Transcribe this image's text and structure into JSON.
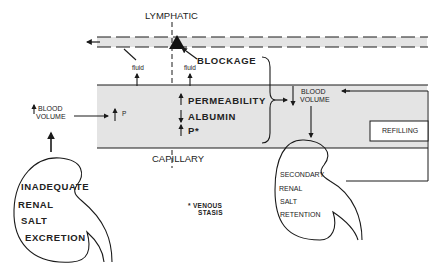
{
  "diagram": {
    "lymphatic": {
      "label": "LYMPHATIC",
      "blockage_label": "BLOCKAGE"
    },
    "fluid_labels": [
      "fluid",
      "fluid"
    ],
    "capillary": {
      "label": "CAPILLARY",
      "left_factor": "P",
      "right_factors": [
        "PERMEABILITY",
        "ALBUMIN",
        "P*"
      ],
      "right_factor_directions": [
        "up",
        "down",
        "up"
      ]
    },
    "left_blood_volume": {
      "line1": "BLOOD",
      "line2": "VOLUME",
      "direction": "up"
    },
    "right_blood_volume": {
      "line1": "BLOOD",
      "line2": "VOLUME",
      "direction": "down"
    },
    "refilling": {
      "label": "REFILLING"
    },
    "left_kidney": {
      "lines": [
        "INADEQUATE",
        "RENAL",
        "SALT",
        "EXCRETION"
      ]
    },
    "right_kidney": {
      "lines": [
        "SECONDARY",
        "RENAL",
        "SALT",
        "RETENTION"
      ]
    },
    "footnote": {
      "symbol": "*",
      "line1": "VENOUS",
      "line2": "STASIS"
    },
    "colors": {
      "band_fill": "#e4e4e4",
      "line": "#1a1a1a"
    }
  }
}
